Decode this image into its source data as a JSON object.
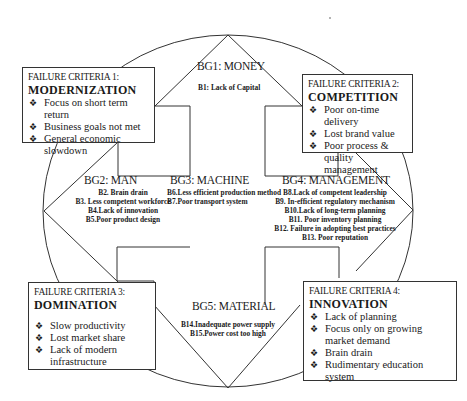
{
  "groups": {
    "bg1": {
      "label": "BG1: MONEY",
      "items": [
        "B1: Lack of Capital"
      ]
    },
    "bg2": {
      "label": "BG2: MAN",
      "items": [
        "B2. Brain drain",
        "B3. Less competent workforce",
        "B4.Lack of innovation",
        "B5.Poor product design"
      ]
    },
    "bg3": {
      "label": "BG3: MACHINE",
      "items": [
        "B6.Less efficient production method",
        "B7.Poor transport system"
      ]
    },
    "bg4": {
      "label": "BG4: MANAGEMENT",
      "items": [
        "B8.Lack of competent leadership",
        "B9. In-efficient regulatory mechanism",
        "B10.Lack of long-term planning",
        "B11. Poor inventory planning",
        "B12. Failure in adopting best practices",
        "B13. Poor reputation"
      ]
    },
    "bg5": {
      "label": "BG5: MATERIAL",
      "items": [
        "B14.Inadequate power supply",
        "B15.Power cost too high"
      ]
    }
  },
  "criteria": {
    "c1": {
      "heading": "FAILURE CRITERIA 1:",
      "title": "MODERNIZATION",
      "bullets": [
        "Focus on short term return",
        "Business goals not met",
        "General economic slowdown"
      ]
    },
    "c2": {
      "heading": "FAILURE CRITERIA 2:",
      "title": "COMPETITION",
      "bullets": [
        "Poor on-time delivery",
        "Lost brand value",
        "Poor process & quality management"
      ]
    },
    "c3": {
      "heading": "FAILURE CRITERIA 3:",
      "title": "DOMINATION",
      "bullets": [
        "Slow productivity",
        "Lost market share",
        "Lack of modern infrastructure"
      ]
    },
    "c4": {
      "heading": "FAILURE CRITERIA 4:",
      "title": "INNOVATION",
      "bullets": [
        "Lack of planning",
        "Focus only on growing market demand",
        "Brain drain",
        "Rudimentary education system"
      ]
    }
  },
  "bullet_glyph": "❖",
  "colors": {
    "line": "#333333",
    "text": "#1a1a1a",
    "background": "#ffffff"
  }
}
